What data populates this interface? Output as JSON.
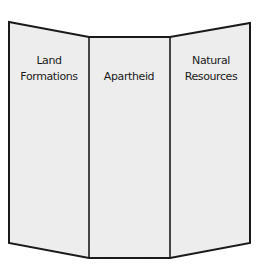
{
  "diagram": {
    "type": "trifold-brochure",
    "colors": {
      "fill": "#ececec",
      "stroke": "#1a1a1a",
      "background": "#ffffff",
      "text": "#1a1a1a"
    },
    "panels": [
      {
        "id": "left",
        "lines": [
          "Land",
          "Formations"
        ]
      },
      {
        "id": "center",
        "lines": [
          "Apartheid"
        ]
      },
      {
        "id": "right",
        "lines": [
          "Natural",
          "Resources"
        ]
      }
    ]
  }
}
